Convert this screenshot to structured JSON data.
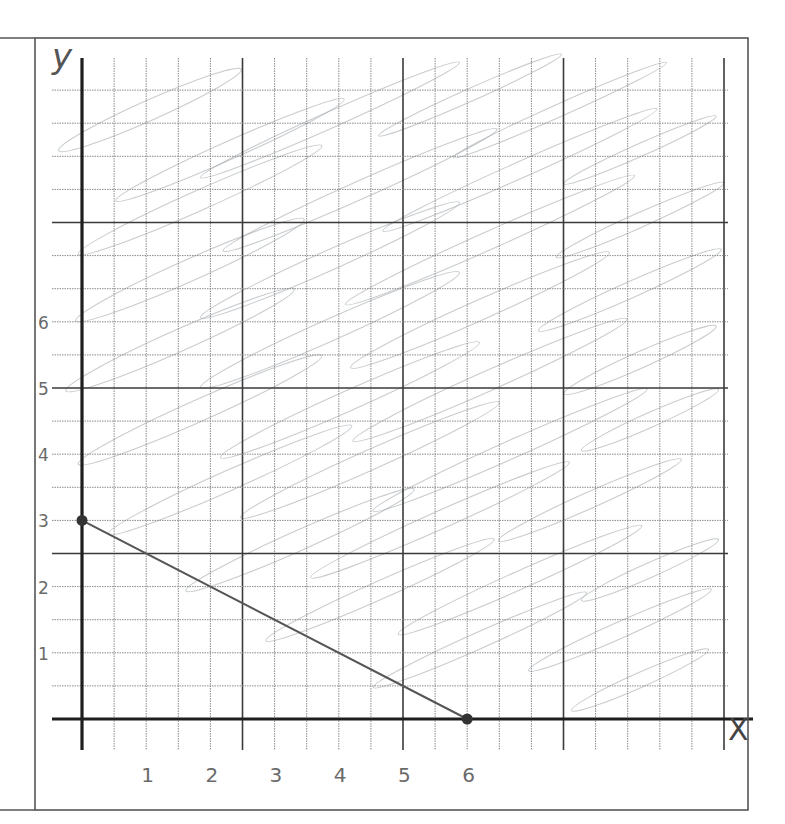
{
  "page": {
    "axis_labels": {
      "y": "y",
      "x": "X"
    },
    "colors": {
      "background": "#ffffff",
      "frame": "#555555",
      "grid_minor": "#8a8a8a",
      "grid_major": "#3a3a3a",
      "axis": "#1e1e1e",
      "line": "#555555",
      "point": "#333333",
      "shading": "#9aa3a8",
      "label": "#6a6a6a"
    }
  },
  "chart_data": {
    "type": "line",
    "title": "",
    "xlabel": "X",
    "ylabel": "y",
    "x_ticks": [
      "1",
      "2",
      "3",
      "4",
      "5",
      "6"
    ],
    "y_ticks": [
      "1",
      "2",
      "3",
      "4",
      "5",
      "6"
    ],
    "xlim": [
      0,
      10
    ],
    "ylim": [
      0,
      10
    ],
    "grid": true,
    "grid_step": 0.5,
    "series": [
      {
        "name": "boundary line",
        "points": [
          {
            "x": 0,
            "y": 3
          },
          {
            "x": 6,
            "y": 0
          }
        ],
        "style": "solid"
      }
    ],
    "marked_points": [
      {
        "x": 0,
        "y": 3
      },
      {
        "x": 6,
        "y": 0
      }
    ],
    "shaded_region": "above the line (pencil scribble shading)",
    "legend": null
  }
}
